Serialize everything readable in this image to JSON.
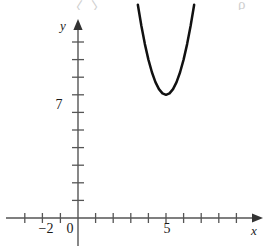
{
  "figure": {
    "name": "parabola-graph",
    "background_color": "#ffffff",
    "ink_color": "#1a1a1a",
    "curve_color": "#111111",
    "axis_color": "#555555",
    "width": 270,
    "height": 246
  },
  "axes": {
    "x_axis_label": "x",
    "y_axis_label": "y",
    "origin_label": "0",
    "x_tick_labels": [
      {
        "text": "−2",
        "value": -2
      },
      {
        "text": "5",
        "value": 5
      }
    ],
    "y_tick_labels": [
      {
        "text": "7",
        "value": 7
      }
    ]
  },
  "top_fragment": {
    "left_text": "〈  〉,",
    "right_text": "ρ"
  },
  "chart_data": {
    "type": "line",
    "title": "",
    "xlabel": "x",
    "ylabel": "y",
    "grid": false,
    "legend": null,
    "xlim": [
      -3.7,
      10.4
    ],
    "ylim": [
      -1.6,
      12.4
    ],
    "x_ticks": [
      -3,
      -2,
      -1,
      0,
      1,
      2,
      3,
      4,
      5,
      6,
      7,
      8,
      9,
      10
    ],
    "x_ticks_labeled": [
      -2,
      5
    ],
    "y_ticks": [
      1,
      2,
      3,
      4,
      5,
      6,
      7,
      8,
      9,
      10,
      11
    ],
    "y_ticks_labeled": [
      7
    ],
    "series": [
      {
        "name": "parabola",
        "equation": "y = 2(x - 5)^2 + 7",
        "vertex": [
          5,
          7
        ],
        "x": [
          3.4,
          3.6,
          3.8,
          4.0,
          4.2,
          4.4,
          4.6,
          4.8,
          5.0,
          5.2,
          5.4,
          5.6,
          5.8,
          6.0,
          6.2,
          6.4,
          6.6
        ],
        "values": [
          12.12,
          10.92,
          9.88,
          9.0,
          8.28,
          7.72,
          7.32,
          7.08,
          7.0,
          7.08,
          7.32,
          7.72,
          8.28,
          9.0,
          9.88,
          10.92,
          12.12
        ]
      }
    ]
  }
}
